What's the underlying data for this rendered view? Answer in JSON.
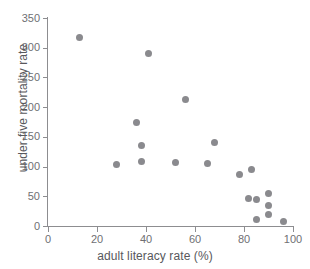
{
  "chart_data": {
    "type": "scatter",
    "title": "",
    "xlabel": "adult literacy rate (%)",
    "ylabel": "under-five mortality rate",
    "xlim": [
      0,
      100
    ],
    "ylim": [
      0,
      350
    ],
    "xticks": [
      0,
      20,
      40,
      60,
      80,
      100
    ],
    "yticks": [
      0,
      50,
      100,
      150,
      200,
      250,
      300,
      350
    ],
    "xtick_labels": [
      "0",
      "20",
      "40",
      "60",
      "80",
      "100"
    ],
    "ytick_labels": [
      "0",
      "50",
      "100",
      "150",
      "200",
      "250",
      "300",
      "350"
    ],
    "grid": false,
    "legend": null,
    "marker": {
      "shape": "circle",
      "color": "#8a8a8e",
      "size_px": 7
    },
    "series": [
      {
        "name": "countries",
        "points": [
          {
            "x": 13,
            "y": 318
          },
          {
            "x": 41,
            "y": 291
          },
          {
            "x": 56,
            "y": 213
          },
          {
            "x": 36,
            "y": 174
          },
          {
            "x": 68,
            "y": 141
          },
          {
            "x": 38,
            "y": 135
          },
          {
            "x": 38,
            "y": 108
          },
          {
            "x": 52,
            "y": 107
          },
          {
            "x": 65,
            "y": 105
          },
          {
            "x": 28,
            "y": 103
          },
          {
            "x": 83,
            "y": 95
          },
          {
            "x": 78,
            "y": 86
          },
          {
            "x": 90,
            "y": 55
          },
          {
            "x": 82,
            "y": 46
          },
          {
            "x": 85,
            "y": 44
          },
          {
            "x": 90,
            "y": 34
          },
          {
            "x": 90,
            "y": 19
          },
          {
            "x": 85,
            "y": 11
          },
          {
            "x": 96,
            "y": 8
          }
        ]
      }
    ]
  },
  "axes": {
    "x_title": "adult literacy rate (%)",
    "y_title": "under-five mortality rate"
  }
}
